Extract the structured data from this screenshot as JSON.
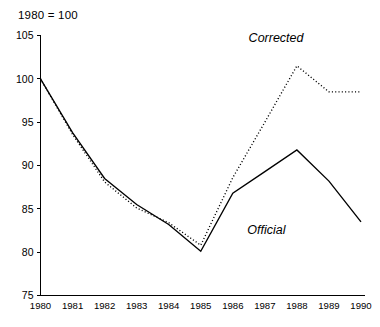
{
  "chart_data": {
    "type": "line",
    "title": "1980 = 100",
    "xlabel": "",
    "ylabel": "",
    "x": [
      1980,
      1981,
      1982,
      1983,
      1984,
      1985,
      1986,
      1987,
      1988,
      1989,
      1990
    ],
    "xtick_labels": [
      "1980",
      "1981",
      "1982",
      "1983",
      "1984",
      "1985",
      "1986",
      "1987",
      "1988",
      "1989",
      "1990"
    ],
    "ytick_labels": [
      "105",
      "100",
      "95",
      "90",
      "85",
      "80",
      "75"
    ],
    "yticks": [
      105,
      100,
      95,
      90,
      85,
      80,
      75
    ],
    "xlim": [
      1980,
      1990
    ],
    "ylim": [
      75,
      105
    ],
    "grid": false,
    "legend_position": "inline-annotation",
    "series": [
      {
        "name": "Corrected",
        "style": "dotted",
        "color": "#000000",
        "values": [
          100.0,
          93.6,
          88.1,
          85.1,
          83.4,
          80.8,
          88.6,
          95.0,
          101.5,
          98.5,
          98.5
        ]
      },
      {
        "name": "Official",
        "style": "solid",
        "color": "#000000",
        "values": [
          100.0,
          93.8,
          88.5,
          85.5,
          83.2,
          80.1,
          86.8,
          89.3,
          91.8,
          88.2,
          83.5
        ]
      }
    ],
    "annotations": [
      {
        "text": "Corrected",
        "x": 1987.35,
        "y": 104.3
      },
      {
        "text": "Official",
        "x": 1987.05,
        "y": 82.1
      }
    ]
  }
}
